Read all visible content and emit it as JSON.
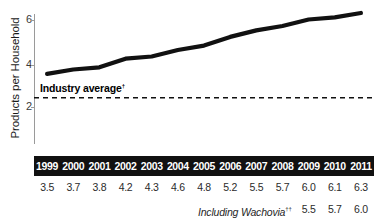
{
  "chart_data": {
    "type": "line",
    "title": "",
    "xlabel": "",
    "ylabel": "Products per Household",
    "categories": [
      "1999",
      "2000",
      "2001",
      "2002",
      "2003",
      "2004",
      "2005",
      "2006",
      "2007",
      "2008",
      "2009",
      "2010",
      "2011"
    ],
    "values": [
      3.5,
      3.7,
      3.8,
      4.2,
      4.3,
      4.6,
      4.8,
      5.2,
      5.5,
      5.7,
      6.0,
      6.1,
      6.3
    ],
    "value_labels": [
      "3.5",
      "3.7",
      "3.8",
      "4.2",
      "4.3",
      "4.6",
      "4.8",
      "5.2",
      "5.5",
      "5.7",
      "6.0",
      "6.1",
      "6.3"
    ],
    "ylim": [
      0,
      6.6
    ],
    "y_ticks": [
      2,
      4,
      6
    ],
    "y_tick_labels": [
      "2",
      "4",
      "6"
    ],
    "grid": false,
    "legend": "none",
    "series": [
      {
        "name": "Products per Household",
        "values": [
          3.5,
          3.7,
          3.8,
          4.2,
          4.3,
          4.6,
          4.8,
          5.2,
          5.5,
          5.7,
          6.0,
          6.1,
          6.3
        ],
        "color": "#111111",
        "style": "solid",
        "width": 4
      },
      {
        "name": "Industry average",
        "value": 2.4,
        "color": "#111111",
        "style": "dashed",
        "width": 1.6
      }
    ],
    "annotations": [
      {
        "name": "industry-average",
        "text": "Industry average",
        "footnote_marker": "†",
        "value": 2.4
      }
    ],
    "secondary_row": {
      "label": "Including Wachovia",
      "footnote_marker": "††",
      "categories": [
        "2009",
        "2010",
        "2011"
      ],
      "values": [
        5.5,
        5.7,
        6.0
      ],
      "value_labels": [
        "5.5",
        "5.7",
        "6.0"
      ]
    }
  },
  "axis": {
    "y_title": "Products per Household",
    "y_tick_0": "6",
    "y_tick_1": "4",
    "y_tick_2": "2"
  },
  "annotation": {
    "industry_average_text": "Industry average",
    "industry_average_marker": "†"
  },
  "footer": {
    "wachovia_label": "Including Wachovia",
    "wachovia_marker": "††"
  },
  "colors": {
    "series_line": "#111111",
    "dashed_line": "#111111",
    "header_bar": "#111111",
    "header_text": "#ffffff",
    "value_text": "#2b2b2b",
    "axis_line": "#9a9a9a",
    "background": "#ffffff"
  }
}
